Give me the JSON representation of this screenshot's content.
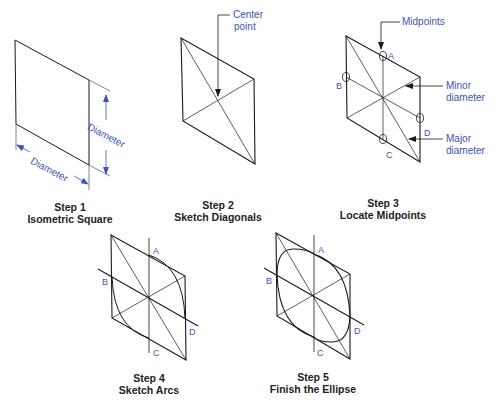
{
  "figure": {
    "accent_color": "#3a55b4",
    "line_color": "#1a1a1a"
  },
  "steps": [
    {
      "number": "Step 1",
      "title": "Isometric Square",
      "labels": {
        "dim_bottom": "Diameter",
        "dim_right": "Diameter"
      }
    },
    {
      "number": "Step 2",
      "title": "Sketch Diagonals",
      "labels": {
        "callout_line1": "Center",
        "callout_line2": "point"
      }
    },
    {
      "number": "Step 3",
      "title": "Locate Midpoints",
      "labels": {
        "midpoints": "Midpoints",
        "minor_line1": "Minor",
        "minor_line2": "diameter",
        "major_line1": "Major",
        "major_line2": "diameter"
      },
      "points": {
        "a": "A",
        "b": "B",
        "c": "C",
        "d": "D"
      }
    },
    {
      "number": "Step 4",
      "title": "Sketch Arcs",
      "points": {
        "a": "A",
        "b": "B",
        "c": "C",
        "d": "D"
      }
    },
    {
      "number": "Step 5",
      "title": "Finish the Ellipse",
      "points": {
        "a": "A",
        "b": "B",
        "c": "C",
        "d": "D"
      }
    }
  ]
}
